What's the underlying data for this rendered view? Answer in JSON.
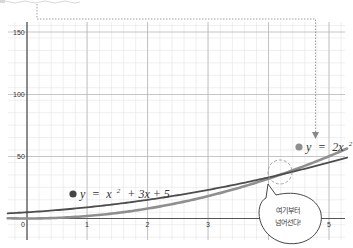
{
  "chart_data": {
    "type": "line",
    "title": "",
    "xlabel": "",
    "ylabel": "",
    "xlim": [
      -0.4,
      5.4
    ],
    "ylim": [
      -12,
      160
    ],
    "grid": true,
    "x_ticks": [
      "0",
      "1",
      "2",
      "3",
      "5"
    ],
    "y_ticks": [
      "50",
      "100",
      "150"
    ],
    "series": [
      {
        "name": "y = x^2 + 3x + 5",
        "label_text": "y = x² + 3x + 5",
        "color": "#4a4a4a",
        "x": [
          0,
          1,
          2,
          3,
          4,
          5
        ],
        "values": [
          5,
          9,
          15,
          23,
          33,
          45
        ]
      },
      {
        "name": "y = 2x^2",
        "label_text": "y = 2x²",
        "color": "#8c8c8c",
        "x": [
          0,
          1,
          2,
          3,
          4,
          5
        ],
        "values": [
          0,
          2,
          8,
          18,
          32,
          50
        ]
      }
    ],
    "annotations": [
      {
        "type": "intersection-marker",
        "x": 4.19,
        "y": 35.1,
        "style": "dashed-circle"
      },
      {
        "type": "speech-bubble",
        "text_line1": "여기부터",
        "text_line2": "넘어선다!"
      },
      {
        "type": "dotted-arrow",
        "target": "y = 2x^2 label"
      }
    ],
    "legend_position": "inline labels"
  },
  "labels": {
    "curve1": {
      "prefix": "y",
      "eq": "=",
      "body": "x",
      "sup": "2",
      "rest": "+ 3x + 5"
    },
    "curve2": {
      "prefix": "y",
      "eq": "=",
      "body": "2x",
      "sup": "2"
    },
    "bubble": {
      "line1": "여기부터",
      "line2": "넘어선다!"
    },
    "ticks": {
      "x0": "0",
      "x1": "1",
      "x2": "2",
      "x3": "3",
      "x5": "5",
      "y50": "50",
      "y100": "100",
      "y150": "150"
    }
  }
}
